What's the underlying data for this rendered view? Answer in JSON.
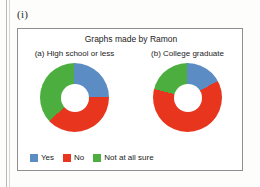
{
  "figure_id": "(i)",
  "panel": {
    "title": "Graphs made by Ramon"
  },
  "colors": {
    "yes": "#5b8cc4",
    "no": "#e8361e",
    "not_sure": "#4cae3f",
    "panel_border": "#8f8f8f",
    "background": "#ffffff"
  },
  "legend": {
    "items": [
      {
        "label": "Yes",
        "color": "#5b8cc4",
        "swatch": "legend-swatch-yes"
      },
      {
        "label": "No",
        "color": "#e8361e",
        "swatch": "legend-swatch-no"
      },
      {
        "label": "Not at all sure",
        "color": "#4cae3f",
        "swatch": "legend-swatch-not-sure"
      }
    ]
  },
  "chart_data": [
    {
      "type": "pie",
      "title": "(a) High school or less",
      "subtitle": "",
      "donut": true,
      "hole_ratio": 0.4,
      "start_angle": 0,
      "direction": "clockwise",
      "labels": [
        "Yes",
        "No",
        "Not at all sure"
      ],
      "values": [
        25,
        38,
        37
      ],
      "colors": [
        "#5b8cc4",
        "#e8361e",
        "#4cae3f"
      ],
      "legend_position": "bottom"
    },
    {
      "type": "pie",
      "title": "(b) College graduate",
      "subtitle": "",
      "donut": true,
      "hole_ratio": 0.4,
      "start_angle": 0,
      "direction": "clockwise",
      "labels": [
        "Yes",
        "No",
        "Not at all sure"
      ],
      "values": [
        17,
        62,
        21
      ],
      "colors": [
        "#5b8cc4",
        "#e8361e",
        "#4cae3f"
      ],
      "legend_position": "bottom"
    }
  ]
}
